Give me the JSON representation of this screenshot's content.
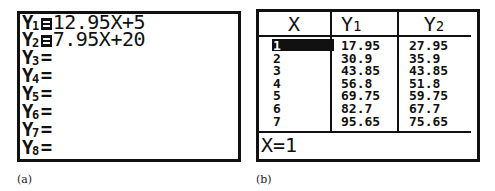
{
  "panel_a": {
    "caption": "(a)",
    "functions": [
      {
        "label": "Y",
        "sub": "1",
        "selected": true,
        "expr": "12.95X+5"
      },
      {
        "label": "Y",
        "sub": "2",
        "selected": true,
        "expr": "7.95X+20"
      },
      {
        "label": "Y",
        "sub": "3",
        "selected": false,
        "expr": ""
      },
      {
        "label": "Y",
        "sub": "4",
        "selected": false,
        "expr": ""
      },
      {
        "label": "Y",
        "sub": "5",
        "selected": false,
        "expr": ""
      },
      {
        "label": "Y",
        "sub": "6",
        "selected": false,
        "expr": ""
      },
      {
        "label": "Y",
        "sub": "7",
        "selected": false,
        "expr": ""
      },
      {
        "label": "Y",
        "sub": "8",
        "selected": false,
        "expr": ""
      }
    ],
    "equals": "="
  },
  "panel_b": {
    "caption": "(b)",
    "headers": [
      "X",
      "Y1",
      "Y2"
    ],
    "header_parts": [
      {
        "main": "X",
        "sub": ""
      },
      {
        "main": "Y",
        "sub": "1"
      },
      {
        "main": "Y",
        "sub": "2"
      }
    ],
    "rows": [
      {
        "x": "1",
        "y1": "17.95",
        "y2": "27.95"
      },
      {
        "x": "2",
        "y1": "30.9",
        "y2": "35.9"
      },
      {
        "x": "3",
        "y1": "43.85",
        "y2": "43.85"
      },
      {
        "x": "4",
        "y1": "56.8",
        "y2": "51.8"
      },
      {
        "x": "5",
        "y1": "69.75",
        "y2": "59.75"
      },
      {
        "x": "6",
        "y1": "82.7",
        "y2": "67.7"
      },
      {
        "x": "7",
        "y1": "95.65",
        "y2": "75.65"
      }
    ],
    "selected_cell": {
      "row": 0,
      "col": "x"
    },
    "status": "X=1"
  }
}
